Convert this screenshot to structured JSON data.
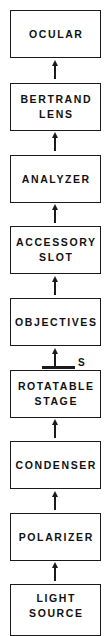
{
  "diagram": {
    "type": "vertical-flow",
    "direction": "bottom-to-top",
    "boxes": [
      {
        "lines": [
          "OCULAR",
          ""
        ]
      },
      {
        "lines": [
          "BERTRAND",
          "LENS"
        ]
      },
      {
        "lines": [
          "ANALYZER",
          ""
        ]
      },
      {
        "lines": [
          "ACCESSORY",
          "SLOT"
        ]
      },
      {
        "lines": [
          "OBJECTIVES",
          ""
        ]
      },
      {
        "lines": [
          "ROTATABLE",
          "STAGE"
        ]
      },
      {
        "lines": [
          "CONDENSER",
          ""
        ]
      },
      {
        "lines": [
          "POLARIZER",
          ""
        ]
      },
      {
        "lines": [
          "LIGHT",
          "SOURCE"
        ]
      }
    ],
    "specimen_marker": {
      "label": "S",
      "position": "between OBJECTIVES and ROTATABLE STAGE"
    },
    "colors": {
      "line": "#1a1a1a",
      "background": "#ffffff",
      "text": "#111111"
    }
  }
}
